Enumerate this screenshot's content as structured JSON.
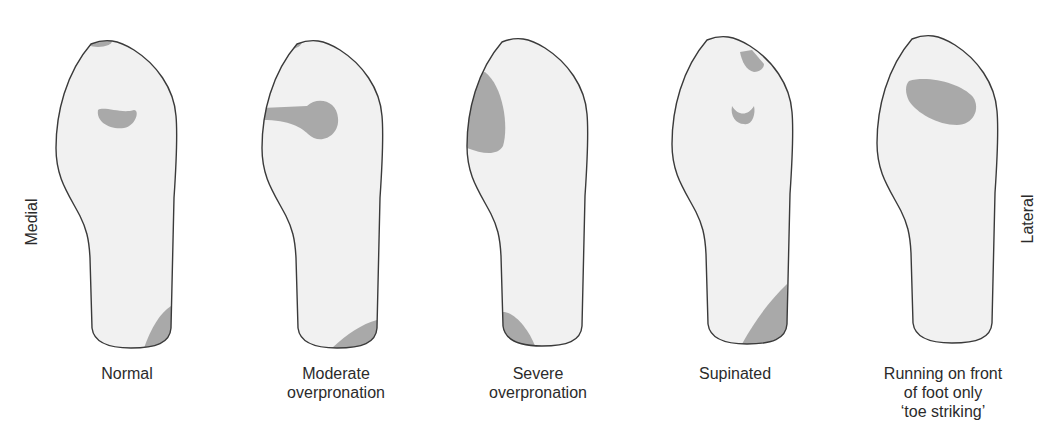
{
  "figure": {
    "type": "footprint pressure diagram",
    "side_labels": {
      "left": "Medial",
      "right": "Lateral"
    },
    "colors": {
      "sole_fill": "#f1f1f1",
      "sole_outline": "#3a3a3a",
      "pressure_fill": "#a9a9a9",
      "background": "#ffffff"
    },
    "panels": [
      {
        "id": "normal",
        "label_lines": [
          "Normal"
        ]
      },
      {
        "id": "moderate",
        "label_lines": [
          "Moderate",
          "overpronation"
        ]
      },
      {
        "id": "severe",
        "label_lines": [
          "Severe",
          "overpronation"
        ]
      },
      {
        "id": "supinated",
        "label_lines": [
          "Supinated"
        ]
      },
      {
        "id": "toe",
        "label_lines": [
          "Running on front",
          "of foot only",
          "‘toe striking’"
        ]
      }
    ]
  }
}
